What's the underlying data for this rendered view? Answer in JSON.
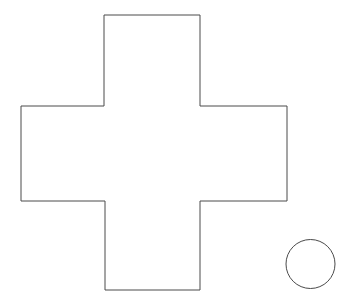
{
  "canvas": {
    "width": 351,
    "height": 300,
    "background_color": "#ffffff",
    "stroke_color": "#4a4a4a",
    "stroke_width": 1,
    "fill_color": "#ffffff"
  },
  "shapes": [
    {
      "name": "cross-polygon",
      "type": "polygon",
      "label": "cross",
      "vertex_count": 12,
      "points": "104,15 200,15 200,106 287,106 287,201 200,201 200,290 105,290 105,201 21,201 21,106 104,106",
      "bounding_box": {
        "x": 21,
        "y": 15,
        "width": 266,
        "height": 275
      },
      "arm_extents": {
        "top_arm": {
          "left": 104,
          "right": 200,
          "top": 15,
          "bottom": 106
        },
        "left_arm": {
          "left": 21,
          "right": 105,
          "top": 106,
          "bottom": 201
        },
        "right_arm": {
          "left": 200,
          "right": 287,
          "top": 106,
          "bottom": 201
        },
        "bottom_arm": {
          "left": 105,
          "right": 200,
          "top": 201,
          "bottom": 290
        }
      }
    },
    {
      "name": "circle-shape",
      "type": "circle",
      "label": "circle",
      "center_x": 310.5,
      "center_y": 264,
      "radius": 24.5,
      "bounding_box": {
        "x": 286,
        "y": 239,
        "width": 49,
        "height": 50
      }
    }
  ]
}
